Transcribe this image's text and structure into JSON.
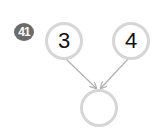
{
  "badge": {
    "number": "41"
  },
  "nodes": {
    "left": {
      "value": "3"
    },
    "right": {
      "value": "4"
    },
    "bottom": {
      "value": ""
    }
  },
  "colors": {
    "badge_bg": "#6b6b6b",
    "circle_border": "#d6d6d6",
    "arrow": "#b0b0b0"
  }
}
